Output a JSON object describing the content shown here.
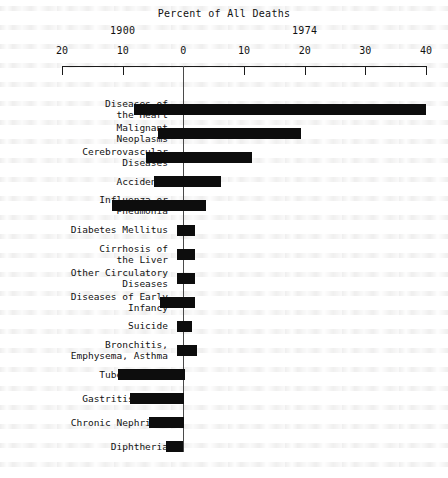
{
  "chart_data": {
    "type": "bar",
    "title": "Percent of All Deaths",
    "xlabel": "",
    "ylabel": "",
    "orientation": "horizontal-diverging",
    "grid": false,
    "legend_position": "top",
    "axis": {
      "tick_labels": [
        "20",
        "10",
        "0",
        "10",
        "20",
        "30",
        "40"
      ],
      "tick_values": [
        -20,
        -10,
        0,
        10,
        20,
        30,
        40
      ],
      "xlim": [
        -20,
        40
      ],
      "left_series_name": "1900",
      "right_series_name": "1974",
      "note": "Left of zero = 1900 percentages; right of zero = 1974 percentages"
    },
    "era_labels": [
      {
        "text": "1900",
        "value": -10
      },
      {
        "text": "1974",
        "value": 20
      }
    ],
    "categories": [
      "Diseases of\nthe Heart",
      "Malignant\nNeoplasms",
      "Cerebrovascular\nDiseases",
      "Accidents",
      "Influenza or\nPneumonia",
      "Diabetes Mellitus",
      "Cirrhosis of\nthe Liver",
      "Other Circulatory\nDiseases",
      "Diseases of Early\nInfancy",
      "Suicide",
      "Bronchitis,\nEmphysema, Asthma",
      "Tuberculosis",
      "Gastritis, etc.",
      "Chronic Nephritis",
      "Diphtheria"
    ],
    "series": [
      {
        "name": "1900",
        "values": [
          8.2,
          4.1,
          6.2,
          4.8,
          11.7,
          1.0,
          1.0,
          1.0,
          3.8,
          1.0,
          1.0,
          10.7,
          8.8,
          5.7,
          2.9
        ]
      },
      {
        "name": "1974",
        "values": [
          40.0,
          19.4,
          11.4,
          6.2,
          3.8,
          2.0,
          1.9,
          1.9,
          2.0,
          1.5,
          2.3,
          0.2,
          0.1,
          0.1,
          0.0
        ]
      }
    ]
  },
  "colors": {
    "bar": "#0d0d0d",
    "axis": "#1a1a1a",
    "zero_line": "#4a4a4a",
    "background": "#ffffff"
  }
}
